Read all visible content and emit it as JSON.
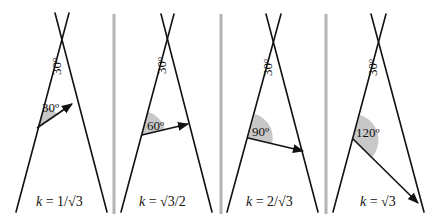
{
  "figure": {
    "apex_angle_label": "30º",
    "panels": [
      {
        "id": "p1",
        "angle_label": "30º",
        "incidence_angle_deg": 30,
        "k_prefix": "k",
        "k_expr": " = 1/√3"
      },
      {
        "id": "p2",
        "angle_label": "60º",
        "incidence_angle_deg": 60,
        "k_prefix": "k",
        "k_expr": " = √3/2"
      },
      {
        "id": "p3",
        "angle_label": "90º",
        "incidence_angle_deg": 90,
        "k_prefix": "k",
        "k_expr": " = 2/√3"
      },
      {
        "id": "p4",
        "angle_label": "120º",
        "incidence_angle_deg": 120,
        "k_prefix": "k",
        "k_expr": " = √3"
      }
    ]
  }
}
